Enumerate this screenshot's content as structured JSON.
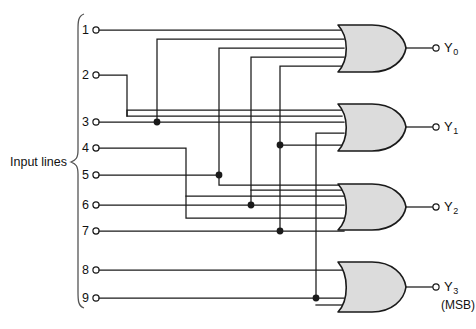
{
  "diagram": {
    "title_text": "",
    "group_label": "Input lines",
    "input_labels": [
      "1",
      "2",
      "3",
      "4",
      "5",
      "6",
      "7",
      "8",
      "9"
    ],
    "output_labels": [
      "Y",
      "Y",
      "Y",
      "Y"
    ],
    "output_subscripts": [
      "0",
      "1",
      "2",
      "3"
    ],
    "msb_note": "(MSB)",
    "colors": {
      "wire": "#1a1a1a",
      "gate_fill": "#dcdcdc",
      "gate_stroke": "#1a1a1a",
      "background": "#ffffff",
      "brace": "#555555"
    },
    "gates": [
      {
        "name": "or-gate-y0",
        "type": "OR",
        "inputs": 5,
        "output": "Y0"
      },
      {
        "name": "or-gate-y1",
        "type": "OR",
        "inputs": 4,
        "output": "Y1"
      },
      {
        "name": "or-gate-y2",
        "type": "OR",
        "inputs": 4,
        "output": "Y2"
      },
      {
        "name": "or-gate-y3",
        "type": "OR",
        "inputs": 2,
        "output": "Y3"
      }
    ]
  },
  "geometry": {
    "input_y": [
      30,
      75,
      122,
      148,
      175,
      205,
      231,
      270,
      298
    ],
    "input_terminal_x": 93,
    "gate_x_left": 338,
    "gate_x_right": 406,
    "output_terminal_x": 437,
    "gate_rows": [
      {
        "top": 25,
        "bottom": 72,
        "mid": 48
      },
      {
        "top": 104,
        "bottom": 151,
        "mid": 127
      },
      {
        "top": 184,
        "bottom": 230,
        "mid": 207
      },
      {
        "top": 262,
        "bottom": 312,
        "mid": 287
      }
    ]
  }
}
